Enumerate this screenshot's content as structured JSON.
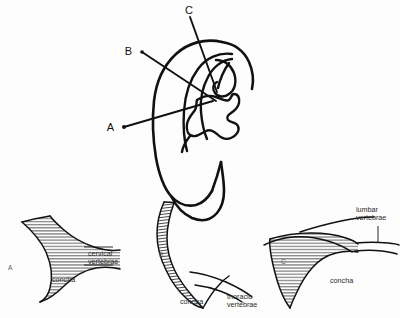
{
  "figure": {
    "background_color": "#fdfdfd",
    "ink_color": "#111111",
    "text_color": "#2a2a2a"
  },
  "ear_diagram": {
    "name": "ear-diagram",
    "markers": [
      {
        "id": "A",
        "label": "A",
        "label_x": 115,
        "label_y": 130,
        "line_from_x": 124,
        "line_from_y": 127,
        "line_to_x": 213,
        "line_to_y": 101
      },
      {
        "id": "B",
        "label": "B",
        "label_x": 133,
        "label_y": 51,
        "line_from_x": 142,
        "line_from_y": 52,
        "line_to_x": 212,
        "line_to_y": 98
      },
      {
        "id": "C",
        "label": "C",
        "label_x": 188,
        "label_y": 13,
        "line_from_x": 190,
        "line_from_y": 17,
        "line_to_x": 214,
        "line_to_y": 90
      }
    ]
  },
  "panels": [
    {
      "id": "A",
      "name": "panel-a",
      "letter": "A",
      "letter_x": 8,
      "letter_y": 268,
      "annotations": [
        {
          "name": "cervical-vertebrae-label",
          "lines": [
            "cervical",
            "vertebrae"
          ],
          "text_x": 88,
          "text_y": 256,
          "leader": "M 84 247 L 112 247"
        },
        {
          "name": "concha-label",
          "lines": [
            "concha"
          ],
          "text_x": 52,
          "text_y": 281,
          "leader": "M 40 277 L 50 277"
        }
      ]
    },
    {
      "id": "B",
      "name": "panel-b",
      "letter": "B",
      "letter_x": 159,
      "letter_y": 255,
      "annotations": [
        {
          "name": "thoracic-vertebrae-label",
          "lines": [
            "thoracic",
            "vertebrae"
          ],
          "text_x": 227,
          "text_y": 297,
          "leader": "M 210 280 L 226 292"
        },
        {
          "name": "concha-label",
          "lines": [
            "concha"
          ],
          "text_x": 180,
          "text_y": 303,
          "leader": "M 172 300 L 179 300"
        }
      ]
    },
    {
      "id": "C",
      "name": "panel-c",
      "letter": "C",
      "letter_x": 281,
      "letter_y": 262,
      "annotations": [
        {
          "name": "lumbar-vertebrae-label",
          "lines": [
            "lumbar",
            "vertebrae"
          ],
          "text_x": 356,
          "text_y": 217,
          "leader": "M 378 226 L 378 240"
        },
        {
          "name": "concha-label",
          "lines": [
            "concha"
          ],
          "text_x": 330,
          "text_y": 282,
          "leader": "M 322 279 L 329 279"
        }
      ]
    }
  ],
  "terms": {
    "concha": "concha",
    "cervical_vertebrae": "cervical vertebrae",
    "thoracic_vertebrae": "thoracic vertebrae",
    "lumbar_vertebrae": "lumbar vertebrae"
  }
}
